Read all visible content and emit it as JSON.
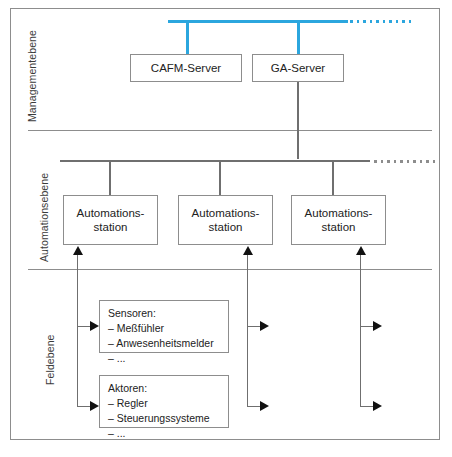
{
  "figure": {
    "caption": ""
  },
  "colors": {
    "bus_management": "#2BA6DE",
    "bus_automation": "#6f6f6f",
    "frame": "#8d8d8d",
    "text": "#222222",
    "arrow": "#111111"
  },
  "levels": [
    {
      "id": "management",
      "label": "Managementebene"
    },
    {
      "id": "automation",
      "label": "Automationsebene"
    },
    {
      "id": "field",
      "label": "Feldebene"
    }
  ],
  "management": {
    "servers": [
      {
        "id": "cafm",
        "label": "CAFM-Server"
      },
      {
        "id": "ga",
        "label": "GA-Server"
      }
    ],
    "bus_continuation": "dotted"
  },
  "automation": {
    "stations": [
      {
        "id": "station-1",
        "line1": "Automations-",
        "line2": "station"
      },
      {
        "id": "station-2",
        "line1": "Automations-",
        "line2": "station"
      },
      {
        "id": "station-3",
        "line1": "Automations-",
        "line2": "station"
      }
    ],
    "bus_continuation": "dotted"
  },
  "field": {
    "groups": [
      {
        "id": "sensoren",
        "title": "Sensoren:",
        "items": [
          "– Meßfühler",
          "– Anwesenheitsmelder",
          "– ..."
        ]
      },
      {
        "id": "aktoren",
        "title": "Aktoren:",
        "items": [
          "– Regler",
          "– Steuerungssysteme",
          "– ..."
        ]
      }
    ]
  }
}
